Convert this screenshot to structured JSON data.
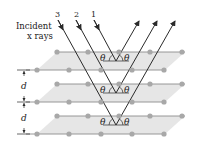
{
  "diagram": {
    "incident_label_line1": "Incident",
    "incident_label_line2": "x rays",
    "ray_labels": [
      "3",
      "2",
      "1"
    ],
    "angle_symbol": "θ",
    "spacing_label": "d",
    "planes": [
      {
        "back_y": 52,
        "front_y": 70
      },
      {
        "back_y": 84,
        "front_y": 102
      },
      {
        "back_y": 116,
        "front_y": 134
      }
    ],
    "back_atoms_x": [
      57,
      88,
      119,
      150,
      182
    ],
    "front_atoms_x": [
      37,
      69,
      101,
      132,
      164
    ],
    "colors": {
      "plane_fill": "#e4e4e4",
      "atom": "#a8a8a8",
      "line": "#8c8c8c",
      "ray": "#2a2a2a"
    }
  }
}
